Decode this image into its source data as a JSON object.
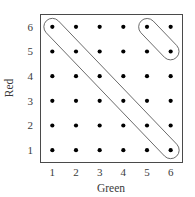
{
  "chart_data": {
    "type": "scatter",
    "title": "",
    "xlabel": "Green",
    "ylabel": "Red",
    "xlim": [
      0.5,
      6.5
    ],
    "ylim": [
      0.5,
      6.5
    ],
    "xticks": [
      "1",
      "2",
      "3",
      "4",
      "5",
      "6"
    ],
    "yticks": [
      "6",
      "5",
      "4",
      "3",
      "2",
      "1"
    ],
    "xtick_values": [
      1,
      2,
      3,
      4,
      5,
      6
    ],
    "ytick_values": [
      6,
      5,
      4,
      3,
      2,
      1
    ],
    "grid": false,
    "y_axis_inverted": true,
    "legend": null,
    "point_color": "#000000",
    "frame_color": "#4a4a4a",
    "annotation_color": "#5a5a5a",
    "background": "#ffffff",
    "points": [
      {
        "x": 1,
        "y": 1
      },
      {
        "x": 2,
        "y": 1
      },
      {
        "x": 3,
        "y": 1
      },
      {
        "x": 4,
        "y": 1
      },
      {
        "x": 5,
        "y": 1
      },
      {
        "x": 6,
        "y": 1
      },
      {
        "x": 1,
        "y": 2
      },
      {
        "x": 2,
        "y": 2
      },
      {
        "x": 3,
        "y": 2
      },
      {
        "x": 4,
        "y": 2
      },
      {
        "x": 5,
        "y": 2
      },
      {
        "x": 6,
        "y": 2
      },
      {
        "x": 1,
        "y": 3
      },
      {
        "x": 2,
        "y": 3
      },
      {
        "x": 3,
        "y": 3
      },
      {
        "x": 4,
        "y": 3
      },
      {
        "x": 5,
        "y": 3
      },
      {
        "x": 6,
        "y": 3
      },
      {
        "x": 1,
        "y": 4
      },
      {
        "x": 2,
        "y": 4
      },
      {
        "x": 3,
        "y": 4
      },
      {
        "x": 4,
        "y": 4
      },
      {
        "x": 5,
        "y": 4
      },
      {
        "x": 6,
        "y": 4
      },
      {
        "x": 1,
        "y": 5
      },
      {
        "x": 2,
        "y": 5
      },
      {
        "x": 3,
        "y": 5
      },
      {
        "x": 4,
        "y": 5
      },
      {
        "x": 5,
        "y": 5
      },
      {
        "x": 6,
        "y": 5
      },
      {
        "x": 1,
        "y": 6
      },
      {
        "x": 2,
        "y": 6
      },
      {
        "x": 3,
        "y": 6
      },
      {
        "x": 4,
        "y": 6
      },
      {
        "x": 5,
        "y": 6
      },
      {
        "x": 6,
        "y": 6
      }
    ],
    "annotations": [
      {
        "name": "anti-diagonal-capsule",
        "shape": "capsule",
        "from": {
          "x": 1,
          "y": 6
        },
        "to": {
          "x": 6,
          "y": 1
        },
        "encloses": [
          {
            "x": 1,
            "y": 6
          },
          {
            "x": 2,
            "y": 5
          },
          {
            "x": 3,
            "y": 4
          },
          {
            "x": 4,
            "y": 3
          },
          {
            "x": 5,
            "y": 2
          },
          {
            "x": 6,
            "y": 1
          }
        ]
      },
      {
        "name": "corner-pair-capsule",
        "shape": "capsule",
        "from": {
          "x": 5,
          "y": 6
        },
        "to": {
          "x": 6,
          "y": 5
        },
        "encloses": [
          {
            "x": 5,
            "y": 6
          },
          {
            "x": 6,
            "y": 5
          }
        ]
      }
    ]
  },
  "axes": {
    "x_title": "Green",
    "y_title": "Red",
    "x_tick_labels": [
      "1",
      "2",
      "3",
      "4",
      "5",
      "6"
    ],
    "y_tick_labels": [
      "6",
      "5",
      "4",
      "3",
      "2",
      "1"
    ]
  }
}
